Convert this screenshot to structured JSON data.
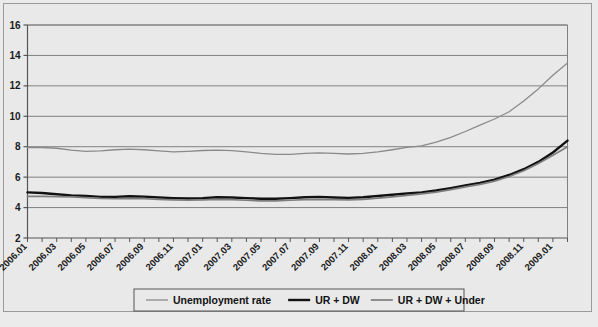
{
  "figure": {
    "background_color": "#e9e9e9",
    "border_color": "#9a9a9a"
  },
  "chart_data": {
    "type": "line",
    "title": "",
    "subtitle": "",
    "xlabel": "",
    "ylabel": "",
    "ylim": [
      2,
      16
    ],
    "ytick_labels": [
      "2",
      "4",
      "6",
      "8",
      "10",
      "12",
      "14",
      "16"
    ],
    "ytick_values": [
      2,
      4,
      6,
      8,
      10,
      12,
      14,
      16
    ],
    "grid": true,
    "grid_axis": "y",
    "legend_position": "bottom-center",
    "x": [
      "2006.01",
      "2006.02",
      "2006.03",
      "2006.04",
      "2006.05",
      "2006.06",
      "2006.07",
      "2006.08",
      "2006.09",
      "2006.10",
      "2006.11",
      "2006.12",
      "2007.01",
      "2007.02",
      "2007.03",
      "2007.04",
      "2007.05",
      "2007.06",
      "2007.07",
      "2007.08",
      "2007.09",
      "2007.10",
      "2007.11",
      "2007.12",
      "2008.01",
      "2008.02",
      "2008.03",
      "2008.04",
      "2008.05",
      "2008.06",
      "2008.07",
      "2008.08",
      "2008.09",
      "2008.10",
      "2008.11",
      "2008.12",
      "2009.01",
      "2009.02"
    ],
    "xtick_labels": [
      "2006.01",
      "2006.03",
      "2006.05",
      "2006.07",
      "2006.09",
      "2006.11",
      "2007.01",
      "2007.03",
      "2007.05",
      "2007.07",
      "2007.09",
      "2007.11",
      "2008.01",
      "2008.03",
      "2008.05",
      "2008.07",
      "2008.09",
      "2008.11",
      "2009.01"
    ],
    "xtick_indices": [
      0,
      2,
      4,
      6,
      8,
      10,
      12,
      14,
      16,
      18,
      20,
      22,
      24,
      26,
      28,
      30,
      32,
      34,
      36
    ],
    "xtick_rotation_deg": 45,
    "series": [
      {
        "name": "Unemployment rate",
        "color": "#8a8a8a",
        "width": 1.3,
        "values": [
          7.95,
          7.95,
          7.9,
          7.78,
          7.7,
          7.72,
          7.8,
          7.84,
          7.8,
          7.72,
          7.66,
          7.7,
          7.75,
          7.78,
          7.74,
          7.66,
          7.56,
          7.5,
          7.5,
          7.56,
          7.6,
          7.56,
          7.52,
          7.56,
          7.66,
          7.8,
          7.96,
          8.05,
          8.3,
          8.62,
          9.0,
          9.42,
          9.82,
          10.3,
          11.0,
          11.8,
          12.7,
          13.5
        ]
      },
      {
        "name": "UR + DW",
        "color": "#111111",
        "width": 2.4,
        "values": [
          5.0,
          4.96,
          4.88,
          4.8,
          4.76,
          4.7,
          4.7,
          4.74,
          4.72,
          4.66,
          4.62,
          4.6,
          4.62,
          4.68,
          4.66,
          4.62,
          4.58,
          4.58,
          4.62,
          4.68,
          4.7,
          4.66,
          4.64,
          4.68,
          4.76,
          4.84,
          4.92,
          5.0,
          5.12,
          5.28,
          5.46,
          5.62,
          5.84,
          6.14,
          6.52,
          7.0,
          7.62,
          8.4
        ]
      },
      {
        "name": "UR + DW + Under",
        "color": "#7d7d7d",
        "width": 1.7,
        "values": [
          4.74,
          4.74,
          4.72,
          4.7,
          4.66,
          4.6,
          4.58,
          4.6,
          4.58,
          4.54,
          4.5,
          4.48,
          4.5,
          4.54,
          4.52,
          4.48,
          4.44,
          4.44,
          4.48,
          4.52,
          4.54,
          4.52,
          4.5,
          4.54,
          4.62,
          4.7,
          4.8,
          4.9,
          5.02,
          5.18,
          5.36,
          5.52,
          5.74,
          6.04,
          6.42,
          6.9,
          7.44,
          8.0
        ]
      }
    ]
  },
  "legend": {
    "entries": [
      {
        "label": "Unemployment rate",
        "color": "#8a8a8a",
        "width": 1.3
      },
      {
        "label": "UR + DW",
        "color": "#111111",
        "width": 2.4
      },
      {
        "label": "UR + DW + Under",
        "color": "#7d7d7d",
        "width": 1.7
      }
    ]
  }
}
